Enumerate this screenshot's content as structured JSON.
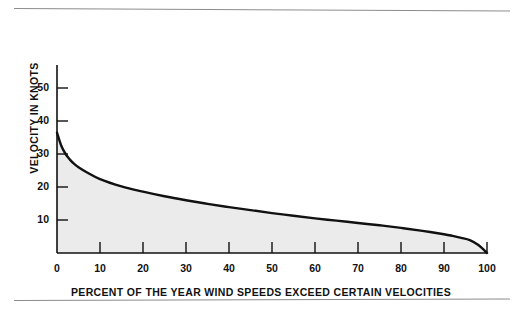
{
  "chart_data": {
    "type": "area",
    "title": "",
    "subtitle": "",
    "xlabel": "PERCENT OF THE YEAR WIND SPEEDS EXCEED CERTAIN VELOCITIES",
    "ylabel": "VELOCITY IN KNOTS",
    "xlim": [
      0,
      100
    ],
    "ylim": [
      0,
      57
    ],
    "grid": false,
    "legend": null,
    "x_ticks": [
      0,
      10,
      20,
      30,
      40,
      50,
      60,
      70,
      80,
      90,
      100
    ],
    "x_tick_labels": [
      "0",
      "10",
      "20",
      "30",
      "40",
      "50",
      "60",
      "70",
      "80",
      "90",
      "100"
    ],
    "y_ticks": [
      10,
      20,
      30,
      40,
      50
    ],
    "y_tick_labels": [
      "10",
      "20",
      "30",
      "40",
      "50"
    ],
    "series": [
      {
        "name": "Wind speed duration curve",
        "fill_color": "#ebebeb",
        "line_color": "#111111",
        "x": [
          0,
          1,
          2,
          3,
          4,
          5,
          7,
          10,
          15,
          20,
          25,
          30,
          35,
          40,
          45,
          50,
          55,
          60,
          65,
          70,
          75,
          80,
          85,
          90,
          92,
          94,
          96,
          98,
          100
        ],
        "values": [
          36.5,
          32.5,
          30.0,
          28.3,
          27.0,
          26.0,
          24.4,
          22.4,
          20.2,
          18.6,
          17.2,
          16.0,
          14.9,
          13.9,
          13.0,
          12.1,
          11.3,
          10.5,
          9.8,
          9.1,
          8.4,
          7.6,
          6.7,
          5.7,
          5.2,
          4.6,
          3.9,
          2.4,
          0.0
        ]
      }
    ],
    "annotations": []
  },
  "figure": {
    "axis_color": "#111111",
    "background": "#ffffff",
    "rule_color": "#8c8c8c"
  }
}
